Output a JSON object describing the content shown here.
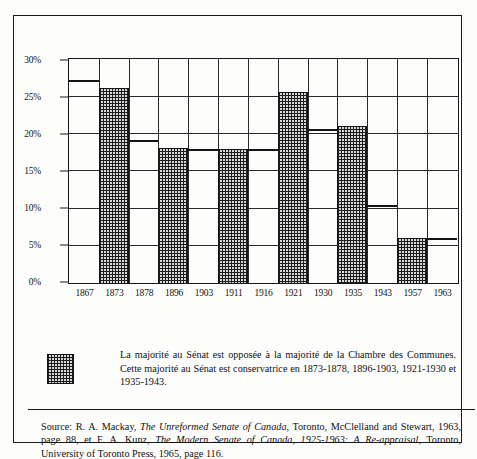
{
  "chart_data": {
    "type": "bar",
    "title": "",
    "xlabel": "",
    "ylabel": "",
    "ylim": [
      0,
      30
    ],
    "ytick_labels": [
      "0%",
      "5%",
      "10%",
      "15%",
      "20%",
      "25%",
      "30%"
    ],
    "ytick_values": [
      0,
      5,
      10,
      15,
      20,
      25,
      30
    ],
    "grid": true,
    "legend_position": "below-plot",
    "categories": [
      "1867",
      "1873",
      "1878",
      "1896",
      "1903",
      "1911",
      "1916",
      "1921",
      "1930",
      "1935",
      "1943",
      "1957",
      "1963"
    ],
    "values": [
      27.3,
      26.3,
      19.3,
      18.2,
      18.0,
      18.0,
      18.0,
      25.7,
      20.7,
      21.1,
      10.5,
      6.0,
      6.0
    ],
    "shaded": [
      false,
      true,
      false,
      true,
      false,
      true,
      false,
      true,
      false,
      true,
      false,
      true,
      false
    ],
    "series": [
      {
        "name": "Majorité au Sénat opposée à la majorité de la Chambre des Communes",
        "values": [
          27.3,
          26.3,
          19.3,
          18.2,
          18.0,
          18.0,
          18.0,
          25.7,
          20.7,
          21.1,
          10.5,
          6.0,
          6.0
        ]
      }
    ],
    "shaded_periods": [
      "1873-1878",
      "1896-1903",
      "1921-1930",
      "1935-1943"
    ]
  },
  "legend": {
    "swatch_name": "checkered-pattern-swatch",
    "text": "La majorité au Sénat est opposée à la majorité de la Chambre des Communes. Cette majorité au Sénat est conservatrice en 1873-1878, 1896-1903, 1921-1930 et 1935-1943."
  },
  "source": {
    "label": "Source:",
    "part1": "R. A. Mackay, ",
    "italic1": "The Unreformed Senate of Canada",
    "part2": ", Toronto, McClelland and Stewart, 1963, page 88, et F. A. Kunz, ",
    "italic2": "The Modern Senate of Canada, 1925-1963: A Re-appraisal",
    "part3": ", Toronto, University of Toronto Press, 1965, page 116."
  },
  "colors": {
    "ink": "#141414",
    "paper": "#fdfdfc",
    "bar_fill": "#d8d8d8"
  }
}
